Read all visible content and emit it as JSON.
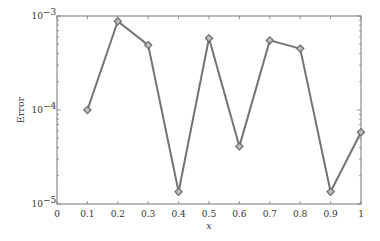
{
  "chart_data": {
    "type": "line",
    "title": "",
    "xlabel": "x",
    "ylabel": "Error",
    "xlim": [
      0,
      1
    ],
    "ylim": [
      1e-05,
      0.001
    ],
    "yscale": "log",
    "grid": false,
    "legend": null,
    "x_ticks": [
      "0",
      "0.1",
      "0.2",
      "0.3",
      "0.4",
      "0.5",
      "0.6",
      "0.7",
      "0.8",
      "0.9",
      "1"
    ],
    "y_ticks": [
      {
        "value": 0.001,
        "base": "10",
        "exp": "−3"
      },
      {
        "value": 0.0001,
        "base": "10",
        "exp": "−4"
      },
      {
        "value": 1e-05,
        "base": "10",
        "exp": "−5"
      }
    ],
    "series": [
      {
        "name": "Error",
        "marker": "diamond",
        "color": "#737373",
        "x": [
          0.1,
          0.2,
          0.3,
          0.4,
          0.5,
          0.6,
          0.7,
          0.8,
          0.9,
          1.0
        ],
        "values": [
          0.0001,
          0.00088,
          0.00049,
          1.35e-05,
          0.00058,
          4.1e-05,
          0.00055,
          0.00045,
          1.35e-05,
          5.8e-05
        ]
      }
    ]
  },
  "layout": {
    "plot_left": 57,
    "plot_right": 361,
    "plot_top": 16,
    "plot_bottom": 204
  }
}
